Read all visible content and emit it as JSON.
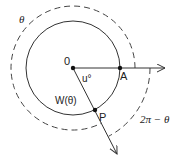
{
  "diagram": {
    "center_label": "0",
    "point_a_label": "A",
    "point_p_label": "P",
    "angle_label": "u°",
    "arc_label_w": "W(θ)",
    "outer_arc_label": "θ",
    "reflex_arc_label": "2π − θ",
    "colors": {
      "stroke": "#333333",
      "background": "#ffffff"
    }
  }
}
